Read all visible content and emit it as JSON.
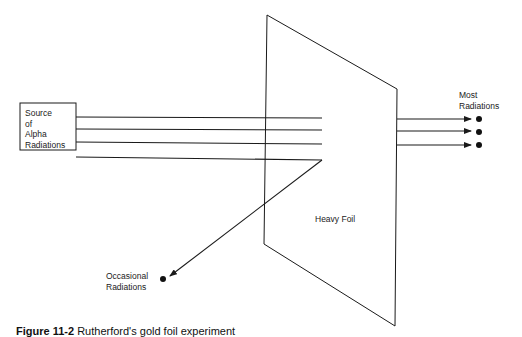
{
  "diagram": {
    "source_box": {
      "label": "Source\nof\nAlpha\nRadiations"
    },
    "foil": {
      "label": "Heavy Foil"
    },
    "outputs": {
      "most": {
        "label": "Most\nRadiations",
        "count": 3
      },
      "occasional": {
        "label": "Occasional\nRadiations",
        "count": 1
      }
    },
    "incoming_beams": 4,
    "stroke_color": "#1a1a1a"
  },
  "caption": {
    "figure_number": "Figure 11-2",
    "text": "Rutherford's gold foil experiment"
  }
}
